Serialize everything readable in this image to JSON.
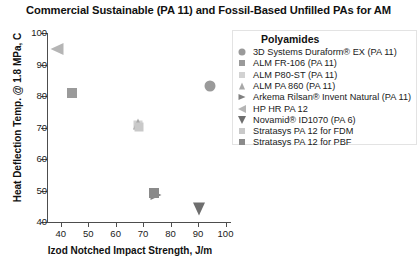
{
  "chart_data": {
    "type": "scatter",
    "title": "Commercial Sustainable (PA 11) and Fossil-Based Unfilled PAs for AM",
    "xlabel": "Izod Notched Impact Strength, J/m",
    "ylabel": "Heat Deflection Temp. @ 1.8 MPa, C",
    "xlim": [
      35,
      102
    ],
    "ylim": [
      40,
      100
    ],
    "xticks": [
      40,
      50,
      60,
      70,
      80,
      90,
      100
    ],
    "yticks": [
      40,
      50,
      60,
      70,
      80,
      90,
      100
    ],
    "grid": false,
    "legend_position": "right",
    "legend_title": "Polyamides",
    "series": [
      {
        "name": "3D Systems Duraform® EX (PA 11)",
        "marker": "circle",
        "color": "#9a9a9a",
        "size": 11,
        "x": 94.5,
        "y": 83.3
      },
      {
        "name": "ALM FR-106 (PA 11)",
        "marker": "square",
        "color": "#9a9a9a",
        "size": 10,
        "x": 44.0,
        "y": 80.8
      },
      {
        "name": "ALM P80-ST (PA 11)",
        "marker": "square",
        "color": "#d2d2d2",
        "size": 9,
        "x": 68.3,
        "y": 70.9
      },
      {
        "name": "ALM PA 860 (PA 11)",
        "marker": "tri-up",
        "color": "#a8a8a8",
        "size": 11,
        "x": 68.3,
        "y": 71.2
      },
      {
        "name": "Arkema Rilsan® Invent Natural (PA 11)",
        "marker": "tri-right",
        "color": "#808080",
        "size": 11,
        "x": 74.6,
        "y": 48.6
      },
      {
        "name": "HP HR PA 12",
        "marker": "tri-left",
        "color": "#b5b5b5",
        "size": 13,
        "x": 38.5,
        "y": 95.0
      },
      {
        "name": "Novamid® ID1070 (PA 6)",
        "marker": "tri-down",
        "color": "#6e6e6e",
        "size": 13,
        "x": 90.5,
        "y": 44.2
      },
      {
        "name": "Stratasys PA 12 for FDM",
        "marker": "square",
        "color": "#c9c9c9",
        "size": 9,
        "x": 68.6,
        "y": 70.1
      },
      {
        "name": "Stratasys PA 12 for PBF",
        "marker": "square",
        "color": "#8a8a8a",
        "size": 10,
        "x": 73.9,
        "y": 49.2
      }
    ]
  }
}
